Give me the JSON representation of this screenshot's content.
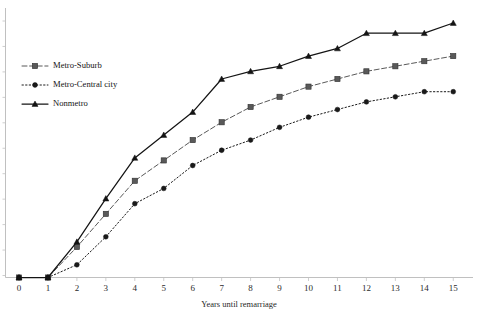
{
  "chart_data": {
    "type": "line",
    "title": "",
    "subtitle": "",
    "xlabel": "Years until remarriage",
    "ylabel": "",
    "x": [
      0,
      1,
      2,
      3,
      4,
      5,
      6,
      7,
      8,
      9,
      10,
      11,
      12,
      13,
      14,
      15
    ],
    "xlim": [
      0,
      15
    ],
    "ylim": [
      0,
      1
    ],
    "xticks": [
      "0",
      "1",
      "2",
      "3",
      "4",
      "5",
      "6",
      "7",
      "8",
      "9",
      "10",
      "11",
      "12",
      "13",
      "14",
      "15"
    ],
    "yticks": [],
    "grid": false,
    "legend_position": "upper-left",
    "series": [
      {
        "name": "Metro-Suburb",
        "marker": "square",
        "linestyle": "dashed",
        "color": "#595959",
        "values": [
          0.0,
          0.0,
          0.12,
          0.25,
          0.38,
          0.46,
          0.54,
          0.61,
          0.67,
          0.71,
          0.75,
          0.78,
          0.81,
          0.83,
          0.85,
          0.87
        ]
      },
      {
        "name": "Metro-Central city",
        "marker": "circle",
        "linestyle": "dotted",
        "color": "#1a1a1a",
        "values": [
          0.0,
          0.0,
          0.05,
          0.16,
          0.29,
          0.35,
          0.44,
          0.5,
          0.54,
          0.59,
          0.63,
          0.66,
          0.69,
          0.71,
          0.73,
          0.73
        ]
      },
      {
        "name": "Nonmetro",
        "marker": "triangle",
        "linestyle": "solid",
        "color": "#141414",
        "values": [
          0.0,
          0.0,
          0.14,
          0.31,
          0.47,
          0.56,
          0.65,
          0.78,
          0.81,
          0.83,
          0.87,
          0.9,
          0.96,
          0.96,
          0.96,
          1.0
        ]
      }
    ]
  },
  "legend": {
    "items": [
      {
        "label": "Metro-Suburb"
      },
      {
        "label": "Metro-Central city"
      },
      {
        "label": "Nonmetro"
      }
    ]
  },
  "axes": {
    "x_title": "Years until remarriage"
  }
}
